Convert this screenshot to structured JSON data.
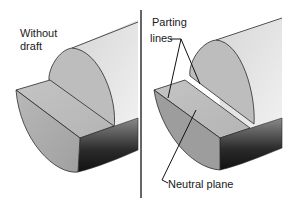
{
  "diagram": {
    "left_panel": {
      "label_line1": "Without",
      "label_line2": "draft"
    },
    "right_panel": {
      "callout_parting_line1": "Parting",
      "callout_parting_line2": "lines",
      "callout_neutral": "Neutral plane"
    },
    "colors": {
      "background": "#ffffff",
      "outline": "#2a2a2a",
      "face_light": "#c8c8c8",
      "face_mid": "#a9a9a9",
      "face_dark": "#1e1e1e",
      "divider": "#333333"
    }
  }
}
